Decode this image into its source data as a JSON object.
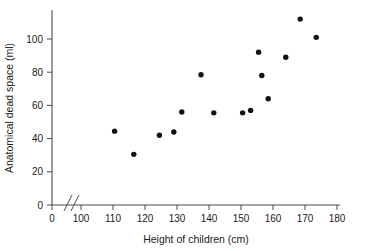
{
  "chart_data": {
    "type": "scatter",
    "title": "",
    "xlabel": "Height of children (cm)",
    "ylabel": "Anatomical dead space (ml)",
    "xlim": [
      100,
      180
    ],
    "ylim": [
      0,
      110
    ],
    "xticks": [
      0,
      100,
      110,
      120,
      130,
      140,
      150,
      160,
      170,
      180
    ],
    "yticks": [
      0,
      20,
      40,
      60,
      80,
      100
    ],
    "xtick_labels": [
      "0",
      "100",
      "110",
      "120",
      "130",
      "140",
      "150",
      "160",
      "170",
      "180"
    ],
    "ytick_labels": [
      "0",
      "20",
      "40",
      "60",
      "80",
      "100"
    ],
    "axis_break": {
      "axis": "x",
      "between": [
        0,
        100
      ],
      "symbol": "//"
    },
    "grid": false,
    "legend": false,
    "marker": "filled-circle",
    "marker_color": "#111111",
    "points": [
      {
        "x": 110.5,
        "y": 44.5
      },
      {
        "x": 116.5,
        "y": 30.5
      },
      {
        "x": 124.5,
        "y": 42.0
      },
      {
        "x": 129.0,
        "y": 44.0
      },
      {
        "x": 131.5,
        "y": 56.0
      },
      {
        "x": 137.5,
        "y": 78.5
      },
      {
        "x": 141.5,
        "y": 55.5
      },
      {
        "x": 150.5,
        "y": 55.5
      },
      {
        "x": 153.0,
        "y": 57.0
      },
      {
        "x": 155.5,
        "y": 92.0
      },
      {
        "x": 156.5,
        "y": 78.0
      },
      {
        "x": 158.5,
        "y": 64.0
      },
      {
        "x": 164.0,
        "y": 89.0
      },
      {
        "x": 168.5,
        "y": 112.0
      },
      {
        "x": 173.5,
        "y": 101.0
      }
    ]
  },
  "figure": {
    "caption": "",
    "xaxis_title": "Height of children (cm)",
    "yaxis_title": "Anatomical dead space (ml)"
  }
}
